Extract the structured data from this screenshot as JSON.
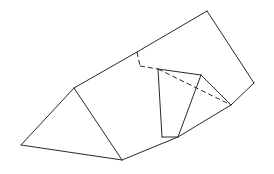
{
  "figure": {
    "line_color": "#2a2a2a",
    "background": "#ffffff",
    "solid_edges": [
      {
        "name": "left-triangle-left-edge",
        "from": "A",
        "to": "B"
      },
      {
        "name": "left-triangle-base",
        "from": "B",
        "to": "C"
      },
      {
        "name": "left-triangle-right-edge",
        "from": "A",
        "to": "C"
      },
      {
        "name": "ridge-edge",
        "from": "A",
        "to": "D"
      },
      {
        "name": "top-edge",
        "from": "D",
        "to": "E"
      },
      {
        "name": "right-edge",
        "from": "E",
        "to": "F"
      },
      {
        "name": "right-lower-edge",
        "from": "F",
        "to": "J"
      },
      {
        "name": "bottom-edge",
        "from": "C",
        "to": "H"
      },
      {
        "name": "pyramid-left-edge",
        "from": "G",
        "to": "K"
      },
      {
        "name": "pyramid-top-edge",
        "from": "G",
        "to": "L"
      },
      {
        "name": "pyramid-front-edge",
        "from": "L",
        "to": "H"
      },
      {
        "name": "pyramid-right-edge",
        "from": "L",
        "to": "J"
      },
      {
        "name": "pyramid-base-edge",
        "from": "K",
        "to": "H"
      },
      {
        "name": "pyramid-lower-edge",
        "from": "H",
        "to": "J"
      }
    ],
    "hidden_edges": [
      {
        "name": "hidden-vertical-edge",
        "from": "D",
        "to": "M"
      },
      {
        "name": "hidden-horizontal-edge",
        "from": "M",
        "to": "G"
      },
      {
        "name": "hidden-diagonal-edge",
        "from": "G",
        "to": "J"
      }
    ]
  }
}
